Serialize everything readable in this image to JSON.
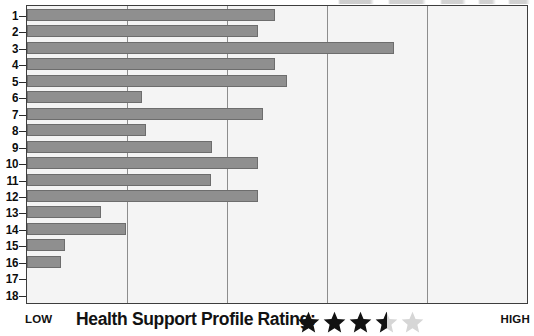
{
  "chart_data": {
    "type": "bar",
    "orientation": "horizontal",
    "title": "",
    "xlabel": "Health Support Profile Rating",
    "ylabel": "",
    "categories": [
      "1",
      "2",
      "3",
      "4",
      "5",
      "6",
      "7",
      "8",
      "9",
      "10",
      "11",
      "12",
      "13",
      "14",
      "15",
      "16",
      "17",
      "18"
    ],
    "values": [
      49.5,
      46.2,
      73.3,
      49.5,
      51.9,
      22.9,
      47.2,
      23.7,
      36.9,
      46.2,
      36.7,
      46.2,
      14.7,
      19.7,
      7.6,
      6.8,
      0,
      0
    ],
    "xlim": [
      0,
      100
    ],
    "ylim": [
      0,
      18
    ],
    "grid": true,
    "gridlines_x": [
      0,
      20,
      40,
      60,
      80,
      100
    ],
    "axis_min_label": "LOW",
    "axis_max_label": "HIGH",
    "legend": [],
    "bar_color": "#8f8f8f",
    "bar_edge_color": "#6d6d6d",
    "plot_background": "#f4f4f4",
    "gridline_color": "#8d8d8d",
    "frame_color": "#3d3d3d"
  },
  "axis": {
    "tick_labels": [
      "1",
      "2",
      "3",
      "4",
      "5",
      "6",
      "7",
      "8",
      "9",
      "10",
      "11",
      "12",
      "13",
      "14",
      "15",
      "16",
      "17",
      "18"
    ],
    "low_label": "LOW",
    "high_label": "HIGH"
  },
  "caption": {
    "title": "Health Support Profile Rating:",
    "rating_value": 3.5,
    "rating_max": 5,
    "star_states": [
      "full",
      "full",
      "full",
      "half",
      "empty"
    ],
    "star_filled_color": "#121212",
    "star_empty_color": "#d6d6d6"
  }
}
